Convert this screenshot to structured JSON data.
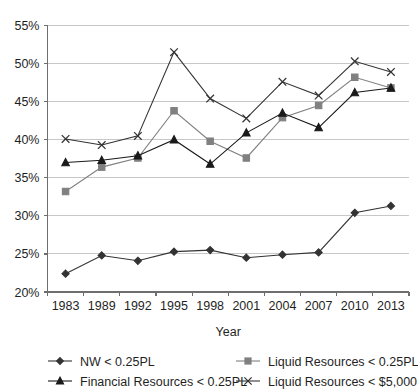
{
  "chart_data": {
    "type": "line",
    "title": "",
    "xlabel": "Year",
    "ylabel": "",
    "categories": [
      "1983",
      "1989",
      "1992",
      "1995",
      "1998",
      "2001",
      "2004",
      "2007",
      "2010",
      "2013"
    ],
    "ylim": [
      20,
      55
    ],
    "ytick_values": [
      20,
      25,
      30,
      35,
      40,
      45,
      50,
      55
    ],
    "ytick_labels": [
      "20%",
      "25%",
      "30%",
      "35%",
      "40%",
      "45%",
      "50%",
      "55%"
    ],
    "grid": true,
    "legend_position": "bottom",
    "series": [
      {
        "name": "NW < 0.25PL",
        "marker": "diamond",
        "color": "#333333",
        "values": [
          22.4,
          24.8,
          24.1,
          25.3,
          25.5,
          24.5,
          24.9,
          25.2,
          30.4,
          31.3
        ]
      },
      {
        "name": "Liquid Resources < 0.25PL",
        "marker": "square",
        "color": "#808080",
        "values": [
          33.2,
          36.4,
          37.6,
          43.8,
          39.8,
          37.6,
          42.9,
          44.5,
          48.2,
          46.8
        ]
      },
      {
        "name": "Financial Resources < 0.25PL",
        "marker": "triangle",
        "color": "#1a1a1a",
        "values": [
          37.0,
          37.3,
          37.9,
          40.0,
          36.8,
          40.9,
          43.5,
          41.6,
          46.2,
          46.8
        ]
      },
      {
        "name": "Liquid Resources < $5,000",
        "marker": "cross",
        "color": "#333333",
        "values": [
          40.1,
          39.3,
          40.5,
          51.5,
          45.4,
          42.8,
          47.6,
          45.8,
          50.3,
          48.9
        ]
      }
    ]
  },
  "legend": {
    "entries": [
      {
        "label": "NW < 0.25PL",
        "marker": "diamond",
        "color": "#333333"
      },
      {
        "label": "Liquid Resources < 0.25PL",
        "marker": "square",
        "color": "#808080"
      },
      {
        "label": "Financial Resources < 0.25PL",
        "marker": "triangle",
        "color": "#1a1a1a"
      },
      {
        "label": "Liquid Resources < $5,000",
        "marker": "cross",
        "color": "#333333"
      }
    ]
  },
  "axes": {
    "x_title": "Year"
  }
}
